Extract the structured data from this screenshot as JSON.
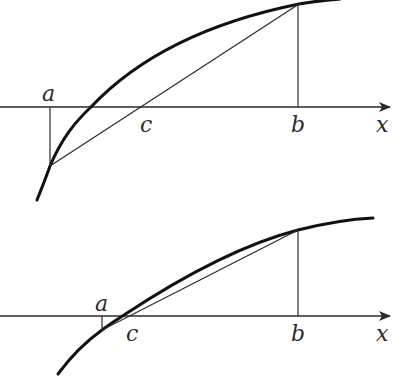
{
  "figure": {
    "panels": [
      {
        "id": "top",
        "labels": {
          "a": "a",
          "b": "b",
          "c": "c",
          "axis": "x"
        }
      },
      {
        "id": "bottom",
        "labels": {
          "a": "a",
          "b": "b",
          "c": "c",
          "axis": "x"
        }
      }
    ],
    "colors": {
      "ink": "#2a2a2a",
      "curve": "#111111",
      "background": "#ffffff"
    }
  }
}
